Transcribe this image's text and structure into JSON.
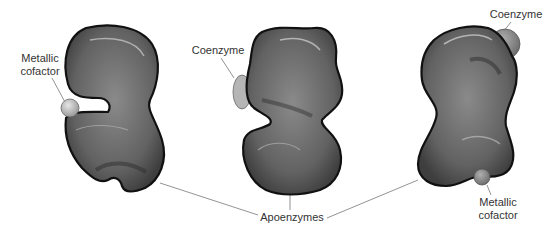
{
  "diagram": {
    "type": "enzyme-cofactor-illustration",
    "colors": {
      "enzyme_body": "#6a6a6a",
      "enzyme_outline": "#111111",
      "cofactor_metallic": "#bdbdbd",
      "coenzyme_left": "#b5b5b5",
      "coenzyme_right": "#7a7a7a",
      "leader_line": "#777777",
      "label_text": "#333333"
    },
    "enzymes": [
      {
        "id": "enzyme-1",
        "position": "left",
        "attached": [
          "metallic-cofactor"
        ]
      },
      {
        "id": "enzyme-2",
        "position": "center",
        "attached": [
          "coenzyme"
        ]
      },
      {
        "id": "enzyme-3",
        "position": "right",
        "attached": [
          "coenzyme",
          "metallic-cofactor"
        ]
      }
    ],
    "labels": {
      "metallic_cofactor_left": "Metallic\ncofactor",
      "coenzyme_center": "Coenzyme",
      "coenzyme_right": "Coenzyme",
      "apoenzymes": "Apoenzymes",
      "metallic_cofactor_right": "Metallic\ncofactor"
    }
  }
}
